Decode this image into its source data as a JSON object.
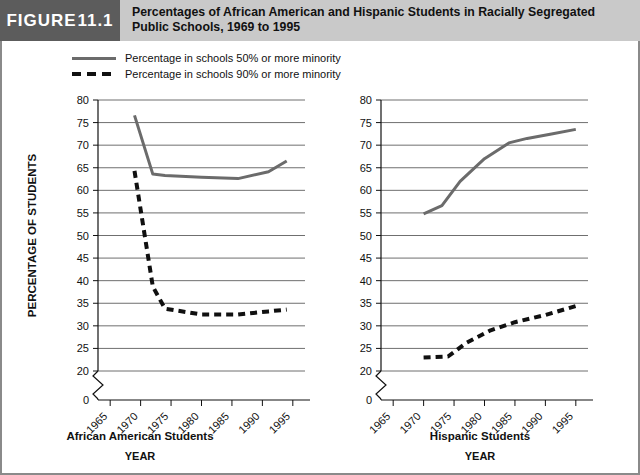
{
  "figure": {
    "badge_word": "FIGURE",
    "badge_number": "11.1",
    "title": "Percentages of African American and Hispanic Students in Racially Segregated Public Schools, 1969 to 1995"
  },
  "legend": {
    "items": [
      {
        "key": "solid",
        "label": "Percentage in schools 50% or more minority"
      },
      {
        "key": "dashed",
        "label": "Percentage in schools 90% or more minority"
      }
    ]
  },
  "colors": {
    "solid_line": "#6b6b6b",
    "dashed_line": "#101010",
    "gridline": "#6f6f6f",
    "axis": "#111111",
    "header_band": "#c9c9c9",
    "badge": "#5c5c5c",
    "frame": "#8a8a8a"
  },
  "chart_data": [
    {
      "type": "line",
      "title": "African American Students",
      "xlabel": "YEAR",
      "ylabel": "PERCENTAGE OF STUDENTS",
      "panel": "left",
      "xticks": [
        "1965",
        "1970",
        "1975",
        "1980",
        "1985",
        "1990",
        "1995"
      ],
      "xlim": [
        1963,
        1997
      ],
      "yticks": [
        0,
        20,
        25,
        30,
        35,
        40,
        45,
        50,
        55,
        60,
        65,
        70,
        75,
        80
      ],
      "ylim": [
        20,
        80
      ],
      "axis_break": true,
      "grid": true,
      "legend_position": "above-plot",
      "series": [
        {
          "name": "Percentage in schools 50% or more minority",
          "style": "solid",
          "x": [
            1969,
            1972,
            1974,
            1980,
            1986,
            1991,
            1994
          ],
          "values": [
            76.6,
            63.6,
            63.3,
            62.9,
            62.6,
            64.1,
            66.5
          ]
        },
        {
          "name": "Percentage in schools 90% or more minority",
          "style": "dashed",
          "x": [
            1969,
            1972,
            1974,
            1980,
            1986,
            1991,
            1994
          ],
          "values": [
            64.3,
            38.7,
            33.8,
            32.5,
            32.5,
            33.2,
            33.6
          ]
        }
      ]
    },
    {
      "type": "line",
      "title": "Hispanic Students",
      "xlabel": "YEAR",
      "ylabel": "PERCENTAGE OF STUDENTS",
      "panel": "right",
      "xticks": [
        "1965",
        "1970",
        "1975",
        "1980",
        "1985",
        "1990",
        "1995"
      ],
      "xlim": [
        1963,
        1997
      ],
      "yticks": [
        0,
        20,
        25,
        30,
        35,
        40,
        45,
        50,
        55,
        60,
        65,
        70,
        75,
        80
      ],
      "ylim": [
        20,
        80
      ],
      "axis_break": true,
      "grid": true,
      "legend_position": "above-plot",
      "series": [
        {
          "name": "Percentage in schools 50% or more minority",
          "style": "solid",
          "x": [
            1970,
            1973,
            1976,
            1980,
            1984,
            1987,
            1991,
            1995
          ],
          "values": [
            54.8,
            56.6,
            62.0,
            67.0,
            70.5,
            71.5,
            72.5,
            73.5
          ]
        },
        {
          "name": "Percentage in schools 90% or more minority",
          "style": "dashed",
          "x": [
            1970,
            1974,
            1977,
            1981,
            1985,
            1990,
            1995
          ],
          "values": [
            23.0,
            23.2,
            26.2,
            29.0,
            30.8,
            32.4,
            34.4
          ]
        }
      ]
    }
  ]
}
